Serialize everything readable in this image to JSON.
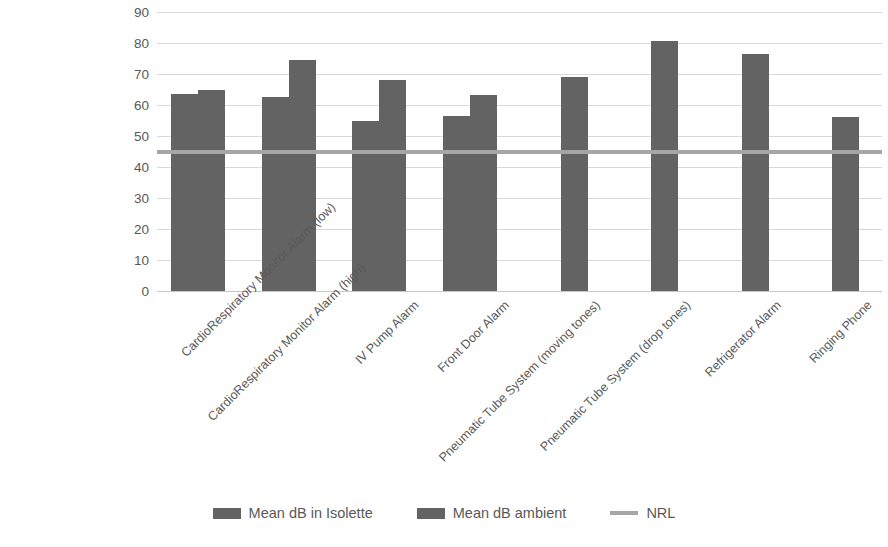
{
  "chart_data": {
    "type": "bar",
    "title": "",
    "xlabel": "",
    "ylabel": "",
    "ylim": [
      0,
      90
    ],
    "ytick_step": 10,
    "yticks": [
      90,
      80,
      70,
      60,
      50,
      40,
      30,
      20,
      10,
      0
    ],
    "grid": true,
    "legend_position": "bottom",
    "categories": [
      "CardioRespiratory Monitor Alarm (low)",
      "CardioRespiratory Monitor Alarm (high)",
      "IV Pump Alarm",
      "Front Door Alarm",
      "Pneumatic Tube System (moving tones)",
      "Pneumatic Tube System (drop tones)",
      "Refrigerator Alarm",
      "Ringing Phone"
    ],
    "series": [
      {
        "name": "Mean dB in Isolette",
        "color": "#636363",
        "values": [
          63.5,
          62.5,
          55.0,
          56.3,
          null,
          null,
          null,
          null
        ]
      },
      {
        "name": "Mean dB ambient",
        "color": "#636363",
        "values": [
          64.8,
          74.6,
          68.0,
          63.3,
          69.0,
          80.5,
          76.5,
          56.0
        ]
      }
    ],
    "reference_lines": [
      {
        "name": "NRL",
        "value": 45,
        "color": "#a6a6a6"
      }
    ]
  },
  "legend": {
    "items": [
      {
        "label": "Mean dB in Isolette",
        "marker": "bar-swatch"
      },
      {
        "label": "Mean dB ambient",
        "marker": "bar-swatch"
      },
      {
        "label": "NRL",
        "marker": "line-swatch"
      }
    ]
  }
}
